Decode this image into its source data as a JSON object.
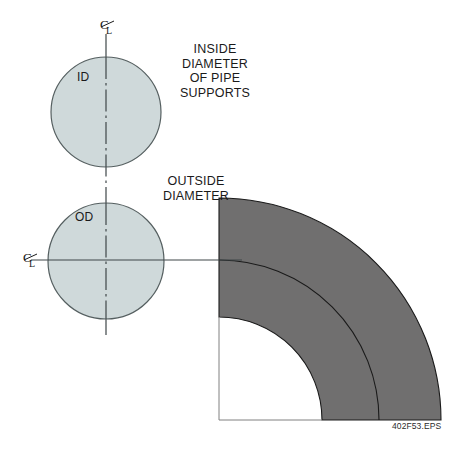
{
  "figure": {
    "caption": "402F53.EPS",
    "colors": {
      "pipe_fill": "#cfd9da",
      "pipe_stroke": "#555f60",
      "elbow_fill": "#706f6f",
      "elbow_stroke": "#1a1a1a",
      "centerline": "#4a5153",
      "text": "#1a1a1a",
      "background": "#ffffff"
    },
    "annotations": {
      "inside_diameter": {
        "text": "INSIDE\nDIAMETER\nOF PIPE\nSUPPORTS",
        "lines": [
          "INSIDE",
          "DIAMETER",
          "OF PIPE",
          "SUPPORTS"
        ]
      },
      "outside_diameter": {
        "text": "OUTSIDE\nDIAMETER",
        "lines": [
          "OUTSIDE",
          "DIAMETER"
        ]
      }
    },
    "pipe_sections": [
      {
        "name": "inside-diameter-circle",
        "label": "ID",
        "center_x": 106,
        "center_y": 112,
        "radius": 55
      },
      {
        "name": "outside-diameter-circle",
        "label": "OD",
        "center_x": 106,
        "center_y": 261,
        "radius": 58
      }
    ],
    "centerline_marks": {
      "top_label": "CL",
      "left_label": "CL"
    },
    "elbow": {
      "name": "pipe-elbow-quarter-annulus",
      "origin_x": 219,
      "origin_y": 420,
      "outer_radius": 222,
      "inner_radius": 103,
      "mid_radius": 160,
      "start_angle_deg": 0,
      "end_angle_deg": 90
    }
  }
}
